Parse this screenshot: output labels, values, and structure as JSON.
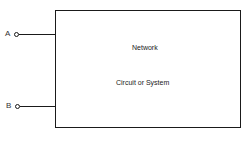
{
  "diagram": {
    "block": {
      "title": "Network",
      "subtitle": "Circuit or System"
    },
    "terminals": [
      {
        "label": "A"
      },
      {
        "label": "B"
      }
    ]
  }
}
